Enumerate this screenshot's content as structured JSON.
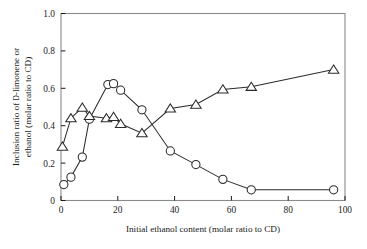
{
  "chart_data": {
    "type": "line",
    "title": "",
    "xlabel": "Initial ethanol content  (molar ratio to CD)",
    "ylabel_line1": "Inclusion ratio of D-limonene or",
    "ylabel_line2": "ethanol (molar ratio to CD)",
    "ylabel_smallcap_prefix": "D",
    "xlim": [
      0,
      100
    ],
    "ylim": [
      0,
      1.0
    ],
    "xticks": [
      0,
      20,
      40,
      60,
      80,
      100
    ],
    "yticks": [
      0,
      0.2,
      0.4,
      0.6,
      0.8,
      1.0
    ],
    "xtick_labels": [
      "0",
      "20",
      "40",
      "60",
      "80",
      "100"
    ],
    "ytick_labels": [
      "0",
      "0.2",
      "0.4",
      "0.6",
      "0.8",
      "1.0"
    ],
    "grid": false,
    "legend": "none",
    "line_color": "#2b2b2b",
    "marker_fill": "#ffffff",
    "series": [
      {
        "name": "d-limonene (circles)",
        "marker": "circle",
        "x": [
          1.0,
          3.5,
          7.5,
          10.0,
          16.5,
          18.5,
          21.0,
          28.5,
          38.5,
          47.5,
          57.0,
          67.0,
          96.0
        ],
        "values": [
          0.085,
          0.125,
          0.232,
          0.435,
          0.62,
          0.625,
          0.59,
          0.485,
          0.265,
          0.192,
          0.113,
          0.057,
          0.057
        ]
      },
      {
        "name": "ethanol (triangles)",
        "marker": "triangle",
        "x": [
          0.5,
          3.5,
          7.5,
          10.0,
          16.0,
          18.5,
          21.0,
          28.5,
          38.5,
          47.5,
          57.0,
          67.0,
          96.0
        ],
        "values": [
          0.288,
          0.44,
          0.497,
          0.452,
          0.44,
          0.447,
          0.41,
          0.36,
          0.492,
          0.513,
          0.594,
          0.608,
          0.7
        ]
      }
    ]
  }
}
